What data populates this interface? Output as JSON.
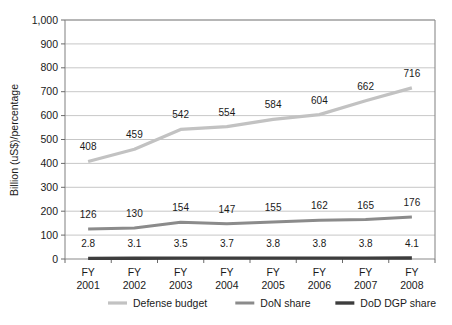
{
  "chart_data": {
    "type": "line",
    "title": "",
    "xlabel": "",
    "ylabel": "Billion (uS$)/percentage",
    "categories": [
      "FY\n2001",
      "FY\n2002",
      "FY\n2003",
      "FY\n2004",
      "FY\n2005",
      "FY\n2006",
      "FY\n2007",
      "FY\n2008"
    ],
    "category_lines": [
      {
        "top": "FY",
        "bottom": "2001"
      },
      {
        "top": "FY",
        "bottom": "2002"
      },
      {
        "top": "FY",
        "bottom": "2003"
      },
      {
        "top": "FY",
        "bottom": "2004"
      },
      {
        "top": "FY",
        "bottom": "2005"
      },
      {
        "top": "FY",
        "bottom": "2006"
      },
      {
        "top": "FY",
        "bottom": "2007"
      },
      {
        "top": "FY",
        "bottom": "2008"
      }
    ],
    "ylim": [
      0,
      1000
    ],
    "yticks": [
      0,
      100,
      200,
      300,
      400,
      500,
      600,
      700,
      800,
      900,
      1000
    ],
    "ytick_labels": [
      "0",
      "100",
      "200",
      "300",
      "400",
      "500",
      "600",
      "700",
      "800",
      "900",
      "1,000"
    ],
    "grid": true,
    "legend_position": "bottom",
    "series": [
      {
        "name": "Defense budget",
        "color": "#c2c2c2",
        "width": 3.2,
        "values": [
          408,
          459,
          542,
          554,
          584,
          604,
          662,
          716
        ],
        "labels": [
          "408",
          "459",
          "542",
          "554",
          "584",
          "604",
          "662",
          "716"
        ]
      },
      {
        "name": "DoN share",
        "color": "#8b8b8b",
        "width": 3.0,
        "values": [
          126,
          130,
          154,
          147,
          155,
          162,
          165,
          176
        ],
        "labels": [
          "126",
          "130",
          "154",
          "147",
          "155",
          "162",
          "165",
          "176"
        ]
      },
      {
        "name": "DoD DGP share",
        "color": "#3d3d3d",
        "width": 3.4,
        "values": [
          2.8,
          3.1,
          3.5,
          3.7,
          3.8,
          3.8,
          3.8,
          4.1
        ],
        "labels": [
          "2.8",
          "3.1",
          "3.5",
          "3.7",
          "3.8",
          "3.8",
          "3.8",
          "4.1"
        ]
      }
    ]
  },
  "legend": {
    "items": [
      {
        "label": "Defense budget",
        "color": "#c2c2c2"
      },
      {
        "label": "DoN share",
        "color": "#8b8b8b"
      },
      {
        "label": "DoD DGP share",
        "color": "#3d3d3d"
      }
    ]
  }
}
